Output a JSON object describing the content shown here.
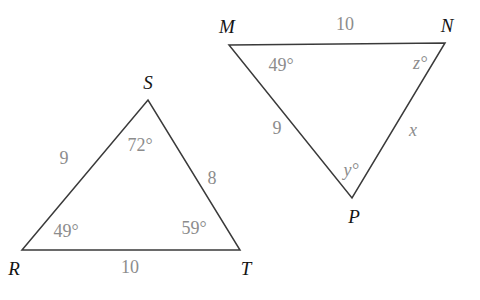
{
  "figure": {
    "background_color": "#ffffff",
    "stroke_color": "#3a3a3a",
    "vertex_label_color": "#141414",
    "measure_label_color": "#8c8c8c"
  },
  "triangles": [
    {
      "id": "RST",
      "name": "triangle-rst",
      "vertices": [
        {
          "label": "R",
          "name": "vertex-label-r",
          "x": 22,
          "y": 250,
          "label_x": 14,
          "label_y": 268
        },
        {
          "label": "S",
          "name": "vertex-label-s",
          "x": 148,
          "y": 100,
          "label_x": 148,
          "label_y": 82
        },
        {
          "label": "T",
          "name": "vertex-label-t",
          "x": 240,
          "y": 250,
          "label_x": 246,
          "label_y": 268
        }
      ],
      "points": "22,250 148,100 240,250",
      "sides": [
        {
          "label": "9",
          "name": "side-label-rs",
          "x": 64,
          "y": 158
        },
        {
          "label": "8",
          "name": "side-label-st",
          "x": 212,
          "y": 178
        },
        {
          "label": "10",
          "name": "side-label-rt",
          "x": 130,
          "y": 267
        }
      ],
      "angles": [
        {
          "label": "49°",
          "name": "angle-label-r",
          "x": 66,
          "y": 231
        },
        {
          "label": "72°",
          "name": "angle-label-s",
          "x": 140,
          "y": 145
        },
        {
          "label": "59°",
          "name": "angle-label-t",
          "x": 194,
          "y": 228
        }
      ]
    },
    {
      "id": "MNP",
      "name": "triangle-mnp",
      "vertices": [
        {
          "label": "M",
          "name": "vertex-label-m",
          "x": 229,
          "y": 45,
          "label_x": 227,
          "label_y": 26
        },
        {
          "label": "N",
          "name": "vertex-label-n",
          "x": 445,
          "y": 43,
          "label_x": 447,
          "label_y": 25
        },
        {
          "label": "P",
          "name": "vertex-label-p",
          "x": 352,
          "y": 198,
          "label_x": 354,
          "label_y": 216
        }
      ],
      "points": "229,45 445,43 352,198",
      "sides": [
        {
          "label": "10",
          "name": "side-label-mn",
          "x": 345,
          "y": 24
        },
        {
          "label": "9",
          "name": "side-label-mp",
          "x": 277,
          "y": 128
        },
        {
          "label": "x",
          "name": "side-label-np",
          "x": 413,
          "y": 130,
          "italic": true
        }
      ],
      "angles": [
        {
          "label": "49°",
          "name": "angle-label-m",
          "x": 281,
          "y": 65
        },
        {
          "label": "z°",
          "name": "angle-label-n",
          "x": 420,
          "y": 63,
          "italic": true
        },
        {
          "label": "y°",
          "name": "angle-label-p",
          "x": 351,
          "y": 170,
          "italic": true
        }
      ]
    }
  ]
}
